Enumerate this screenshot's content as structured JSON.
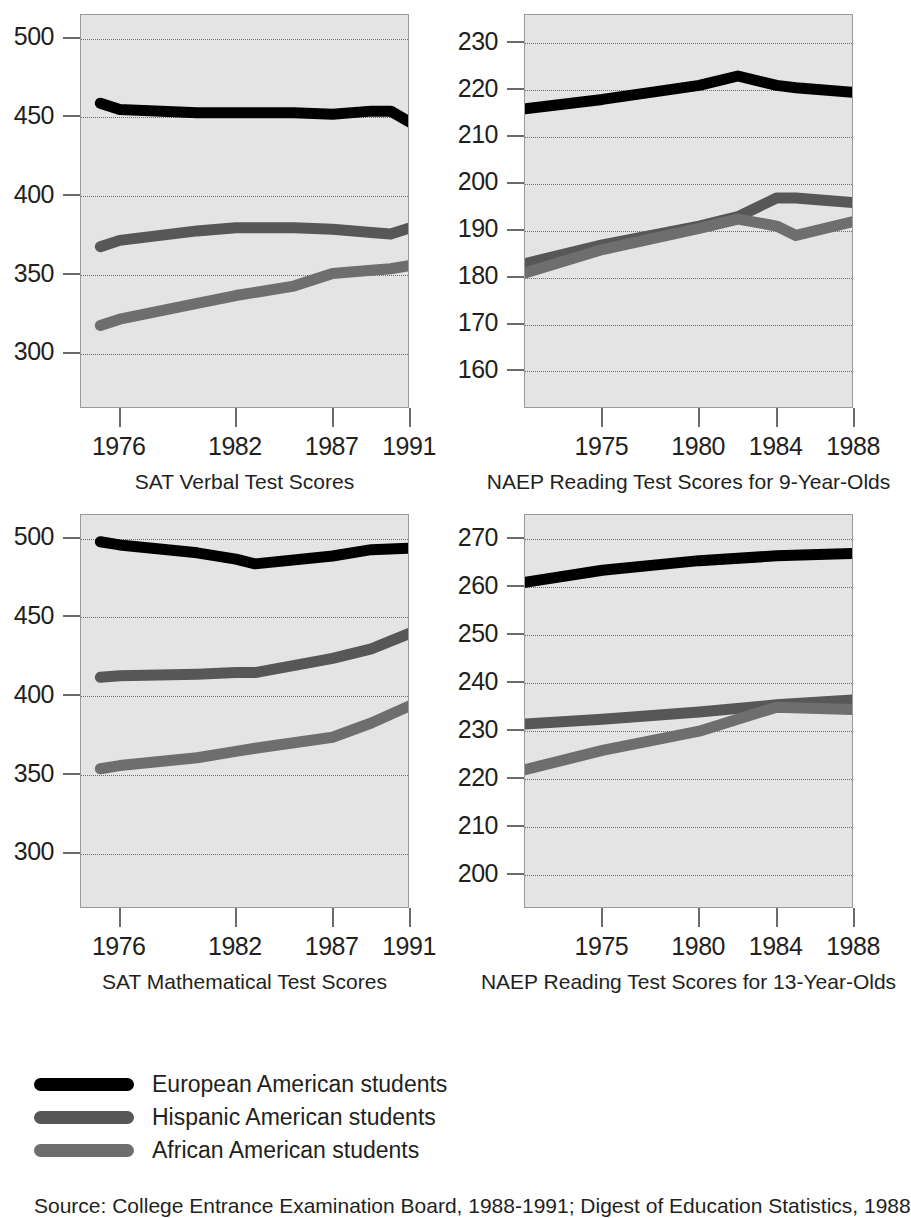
{
  "figure": {
    "legend": {
      "items": [
        {
          "label": "European American students",
          "color": "#000000",
          "key": "european"
        },
        {
          "label": "Hispanic American students",
          "color": "#575757",
          "key": "hispanic"
        },
        {
          "label": "African American students",
          "color": "#6e6e6e",
          "key": "african"
        }
      ]
    },
    "source": "Source: College Entrance Examination Board, 1988-1991; Digest of Education Statistics, 1988"
  },
  "chart_data": [
    {
      "id": "sat-verbal",
      "type": "line",
      "title": "SAT Verbal Test Scores",
      "xlabel": "",
      "ylabel": "",
      "grid": true,
      "legend_position": "below-figure",
      "ylim": [
        265,
        515
      ],
      "yticks": [
        300,
        350,
        400,
        450,
        500
      ],
      "xlim": [
        1974,
        1991
      ],
      "xticks": [
        1976,
        1982,
        1987,
        1991
      ],
      "x": [
        1975,
        1976,
        1980,
        1982,
        1985,
        1987,
        1989,
        1990,
        1991
      ],
      "series": [
        {
          "name": "European American students",
          "color": "#000000",
          "values": [
            459,
            455,
            453,
            453,
            453,
            452,
            454,
            454,
            447
          ]
        },
        {
          "name": "Hispanic American students",
          "color": "#575757",
          "values": [
            368,
            372,
            378,
            380,
            380,
            379,
            377,
            376,
            380
          ]
        },
        {
          "name": "African American students",
          "color": "#6e6e6e",
          "values": [
            318,
            322,
            332,
            337,
            343,
            351,
            353,
            354,
            356
          ]
        }
      ]
    },
    {
      "id": "naep-reading-9",
      "type": "line",
      "title": "NAEP Reading Test Scores for 9-Year-Olds",
      "xlabel": "",
      "ylabel": "",
      "grid": true,
      "legend_position": "below-figure",
      "ylim": [
        152,
        236
      ],
      "yticks": [
        160,
        170,
        180,
        190,
        200,
        210,
        220,
        230
      ],
      "xlim": [
        1971,
        1988
      ],
      "xticks": [
        1975,
        1980,
        1984,
        1988
      ],
      "x": [
        1971,
        1975,
        1980,
        1982,
        1984,
        1985,
        1988
      ],
      "series": [
        {
          "name": "European American students",
          "color": "#000000",
          "values": [
            216,
            218,
            221,
            223,
            221,
            220.5,
            219.5
          ]
        },
        {
          "name": "Hispanic American students",
          "color": "#575757",
          "values": [
            183,
            187,
            191,
            193,
            197,
            197,
            196
          ]
        },
        {
          "name": "African American students",
          "color": "#6e6e6e",
          "values": [
            181,
            186,
            190.5,
            192.5,
            191,
            189,
            192
          ]
        }
      ]
    },
    {
      "id": "sat-math",
      "type": "line",
      "title": "SAT Mathematical Test Scores",
      "xlabel": "",
      "ylabel": "",
      "grid": true,
      "legend_position": "below-figure",
      "ylim": [
        265,
        515
      ],
      "yticks": [
        300,
        350,
        400,
        450,
        500
      ],
      "xlim": [
        1974,
        1991
      ],
      "xticks": [
        1976,
        1982,
        1987,
        1991
      ],
      "x": [
        1975,
        1976,
        1980,
        1982,
        1983,
        1987,
        1989,
        1991
      ],
      "series": [
        {
          "name": "European American students",
          "color": "#000000",
          "values": [
            498,
            496,
            491,
            487,
            484,
            489,
            493,
            494
          ]
        },
        {
          "name": "Hispanic American students",
          "color": "#575757",
          "values": [
            412,
            413,
            414,
            415,
            415,
            424,
            430,
            440
          ]
        },
        {
          "name": "African American students",
          "color": "#6e6e6e",
          "values": [
            354,
            356,
            361,
            365,
            367,
            374,
            383,
            394
          ]
        }
      ]
    },
    {
      "id": "naep-reading-13",
      "type": "line",
      "title": "NAEP Reading Test Scores for 13-Year-Olds",
      "xlabel": "",
      "ylabel": "",
      "grid": true,
      "legend_position": "below-figure",
      "ylim": [
        193,
        275
      ],
      "yticks": [
        200,
        210,
        220,
        230,
        240,
        250,
        260,
        270
      ],
      "xlim": [
        1971,
        1988
      ],
      "xticks": [
        1975,
        1980,
        1984,
        1988
      ],
      "x": [
        1971,
        1975,
        1980,
        1984,
        1988
      ],
      "series": [
        {
          "name": "European American students",
          "color": "#000000",
          "values": [
            261,
            263.5,
            265.5,
            266.5,
            267
          ]
        },
        {
          "name": "Hispanic American students",
          "color": "#575757",
          "values": [
            231.5,
            232.5,
            234,
            235.5,
            236.5
          ]
        },
        {
          "name": "African American students",
          "color": "#6e6e6e",
          "values": [
            222,
            226,
            230,
            235,
            234.5
          ]
        }
      ]
    }
  ]
}
